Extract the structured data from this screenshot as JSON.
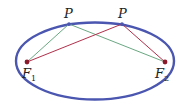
{
  "diagram": {
    "type": "ellipse-foci",
    "colors": {
      "ellipse": "#4a56b0",
      "green_line": "#6aa882",
      "red_line": "#b0304a",
      "focus_dot": "#8a1a2a",
      "point_dot": "#4a56b0"
    },
    "labels": {
      "p1": "P",
      "p2": "P",
      "f1_main": "F",
      "f1_sub": "1",
      "f2_main": "F",
      "f2_sub": "2"
    }
  }
}
